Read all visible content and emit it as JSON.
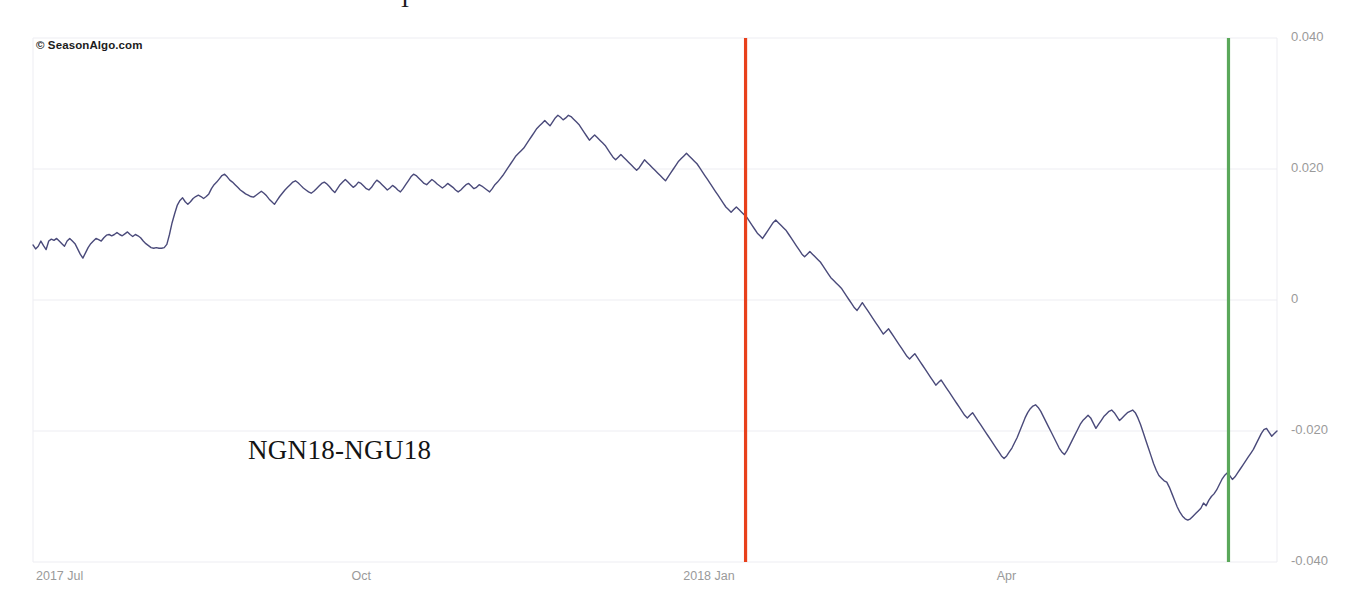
{
  "watermark": "© SeasonAlgo.com",
  "partial_top_text": "T",
  "series_label": "NGN18-NGU18",
  "colors": {
    "line": "#4a4a7a",
    "entry_marker": "#e8401b",
    "exit_marker": "#5aa85a",
    "grid": "#ededf2",
    "axis_text": "#9a9a9a",
    "background": "#ffffff"
  },
  "chart_data": {
    "type": "line",
    "title": "NGN18-NGU18",
    "xlabel": "",
    "ylabel": "",
    "grid": true,
    "legend": "none",
    "ylim": [
      -0.04,
      0.04
    ],
    "yticks": [
      0.04,
      0.02,
      0,
      -0.02,
      -0.04
    ],
    "ytick_labels": [
      "0.040",
      "0.020",
      "0",
      "-0.020",
      "-0.040"
    ],
    "xticks": [
      "2017 Jul",
      "Oct",
      "2018 Jan",
      "Apr"
    ],
    "xtick_positions": [
      0.0,
      0.2537,
      0.5203,
      0.7723
    ],
    "annotations": [
      {
        "name": "entry-line",
        "label": "entry",
        "color": "#e8401b",
        "x_fraction": 0.5728
      },
      {
        "name": "exit-line",
        "label": "exit",
        "color": "#5aa85a",
        "x_fraction": 0.961
      }
    ],
    "series": [
      {
        "name": "NGN18-NGU18",
        "color": "#4a4a7a",
        "values": [
          0.0084,
          0.0078,
          0.0082,
          0.009,
          0.0083,
          0.0077,
          0.009,
          0.0093,
          0.0091,
          0.0094,
          0.009,
          0.0086,
          0.0082,
          0.009,
          0.0094,
          0.009,
          0.0086,
          0.0078,
          0.007,
          0.0064,
          0.0072,
          0.008,
          0.0086,
          0.009,
          0.0094,
          0.0092,
          0.009,
          0.0095,
          0.0099,
          0.01,
          0.0098,
          0.01,
          0.0103,
          0.01,
          0.0098,
          0.0101,
          0.0104,
          0.01,
          0.0097,
          0.01,
          0.0098,
          0.0095,
          0.009,
          0.0086,
          0.0083,
          0.008,
          0.0079,
          0.008,
          0.0079,
          0.0079,
          0.008,
          0.0085,
          0.01,
          0.0118,
          0.0132,
          0.0145,
          0.0152,
          0.0156,
          0.015,
          0.0146,
          0.015,
          0.0155,
          0.0158,
          0.016,
          0.0158,
          0.0155,
          0.0158,
          0.0162,
          0.017,
          0.0176,
          0.018,
          0.0185,
          0.019,
          0.0192,
          0.0188,
          0.0183,
          0.018,
          0.0176,
          0.0172,
          0.0168,
          0.0165,
          0.0162,
          0.016,
          0.0158,
          0.0157,
          0.016,
          0.0163,
          0.0166,
          0.0163,
          0.0159,
          0.0154,
          0.015,
          0.0146,
          0.0152,
          0.0158,
          0.0163,
          0.0168,
          0.0172,
          0.0176,
          0.018,
          0.0182,
          0.0179,
          0.0175,
          0.0171,
          0.0168,
          0.0165,
          0.0163,
          0.0166,
          0.017,
          0.0174,
          0.0178,
          0.018,
          0.0177,
          0.0173,
          0.0168,
          0.0164,
          0.017,
          0.0176,
          0.018,
          0.0184,
          0.018,
          0.0176,
          0.0172,
          0.0175,
          0.018,
          0.0178,
          0.0174,
          0.017,
          0.0168,
          0.0172,
          0.0178,
          0.0183,
          0.018,
          0.0176,
          0.0172,
          0.0168,
          0.0171,
          0.0175,
          0.0172,
          0.0168,
          0.0165,
          0.017,
          0.0176,
          0.0182,
          0.0188,
          0.0192,
          0.019,
          0.0186,
          0.0182,
          0.0178,
          0.0176,
          0.018,
          0.0184,
          0.0181,
          0.0177,
          0.0174,
          0.0171,
          0.0174,
          0.0178,
          0.0175,
          0.0172,
          0.0168,
          0.0165,
          0.0168,
          0.0172,
          0.0176,
          0.0178,
          0.0174,
          0.017,
          0.0172,
          0.0176,
          0.0174,
          0.0171,
          0.0168,
          0.0165,
          0.017,
          0.0176,
          0.018,
          0.0185,
          0.019,
          0.0196,
          0.0202,
          0.0208,
          0.0214,
          0.022,
          0.0224,
          0.0228,
          0.0232,
          0.0238,
          0.0244,
          0.025,
          0.0256,
          0.0262,
          0.0266,
          0.027,
          0.0274,
          0.027,
          0.0266,
          0.0272,
          0.0278,
          0.0282,
          0.0279,
          0.0275,
          0.0278,
          0.0282,
          0.028,
          0.0276,
          0.0272,
          0.0268,
          0.0262,
          0.0256,
          0.025,
          0.0244,
          0.0248,
          0.0252,
          0.0248,
          0.0244,
          0.024,
          0.0236,
          0.023,
          0.0224,
          0.0218,
          0.0214,
          0.0218,
          0.0222,
          0.0218,
          0.0214,
          0.021,
          0.0206,
          0.0202,
          0.0198,
          0.0202,
          0.0208,
          0.0214,
          0.021,
          0.0206,
          0.0202,
          0.0198,
          0.0194,
          0.019,
          0.0186,
          0.0182,
          0.0188,
          0.0194,
          0.02,
          0.0206,
          0.0212,
          0.0216,
          0.022,
          0.0224,
          0.022,
          0.0216,
          0.0212,
          0.0208,
          0.0202,
          0.0196,
          0.019,
          0.0184,
          0.0178,
          0.0172,
          0.0166,
          0.016,
          0.0154,
          0.0148,
          0.0142,
          0.0138,
          0.0134,
          0.0138,
          0.0142,
          0.0138,
          0.0134,
          0.013,
          0.0126,
          0.012,
          0.0114,
          0.0108,
          0.0102,
          0.0098,
          0.0094,
          0.01,
          0.0106,
          0.0112,
          0.0118,
          0.0122,
          0.0118,
          0.0114,
          0.011,
          0.0106,
          0.01,
          0.0094,
          0.0088,
          0.0082,
          0.0076,
          0.007,
          0.0066,
          0.007,
          0.0074,
          0.007,
          0.0066,
          0.0062,
          0.0058,
          0.0052,
          0.0046,
          0.004,
          0.0034,
          0.003,
          0.0026,
          0.0022,
          0.0018,
          0.0012,
          0.0006,
          0.0,
          -0.0006,
          -0.0012,
          -0.0016,
          -0.001,
          -0.0004,
          -0.001,
          -0.0016,
          -0.0022,
          -0.0028,
          -0.0034,
          -0.004,
          -0.0046,
          -0.0052,
          -0.0048,
          -0.0044,
          -0.005,
          -0.0056,
          -0.0062,
          -0.0068,
          -0.0074,
          -0.008,
          -0.0086,
          -0.009,
          -0.0086,
          -0.0082,
          -0.0088,
          -0.0094,
          -0.01,
          -0.0106,
          -0.0112,
          -0.0118,
          -0.0124,
          -0.013,
          -0.0126,
          -0.0122,
          -0.0128,
          -0.0134,
          -0.014,
          -0.0146,
          -0.0152,
          -0.0158,
          -0.0164,
          -0.017,
          -0.0176,
          -0.018,
          -0.0176,
          -0.0172,
          -0.0178,
          -0.0184,
          -0.019,
          -0.0196,
          -0.0202,
          -0.0208,
          -0.0214,
          -0.022,
          -0.0226,
          -0.0232,
          -0.0238,
          -0.0242,
          -0.0238,
          -0.0232,
          -0.0226,
          -0.0218,
          -0.021,
          -0.02,
          -0.019,
          -0.018,
          -0.0172,
          -0.0166,
          -0.0162,
          -0.016,
          -0.0164,
          -0.017,
          -0.0178,
          -0.0186,
          -0.0194,
          -0.0202,
          -0.021,
          -0.0218,
          -0.0226,
          -0.0232,
          -0.0236,
          -0.023,
          -0.0222,
          -0.0214,
          -0.0206,
          -0.0198,
          -0.019,
          -0.0184,
          -0.018,
          -0.0176,
          -0.018,
          -0.0188,
          -0.0196,
          -0.019,
          -0.0184,
          -0.0178,
          -0.0174,
          -0.017,
          -0.0168,
          -0.0172,
          -0.0178,
          -0.0184,
          -0.018,
          -0.0176,
          -0.0172,
          -0.017,
          -0.0168,
          -0.0172,
          -0.018,
          -0.019,
          -0.0202,
          -0.0214,
          -0.0226,
          -0.0238,
          -0.025,
          -0.026,
          -0.0268,
          -0.0272,
          -0.0276,
          -0.0278,
          -0.0286,
          -0.0296,
          -0.0306,
          -0.0316,
          -0.0324,
          -0.033,
          -0.0334,
          -0.0336,
          -0.0334,
          -0.033,
          -0.0326,
          -0.0322,
          -0.0318,
          -0.031,
          -0.0314,
          -0.0306,
          -0.03,
          -0.0296,
          -0.029,
          -0.0282,
          -0.0274,
          -0.0268,
          -0.0264,
          -0.0268,
          -0.0274,
          -0.027,
          -0.0264,
          -0.0258,
          -0.0252,
          -0.0246,
          -0.024,
          -0.0234,
          -0.0228,
          -0.022,
          -0.0212,
          -0.0204,
          -0.0198,
          -0.0196,
          -0.0202,
          -0.0208,
          -0.0204,
          -0.02
        ]
      }
    ]
  }
}
